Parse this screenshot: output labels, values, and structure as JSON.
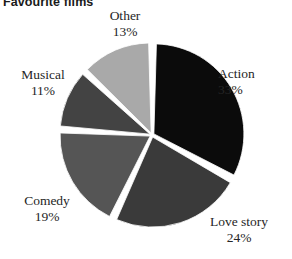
{
  "chart_data": {
    "type": "pie",
    "title": "Favourite films",
    "xlabel": "",
    "ylabel": "",
    "legend_position": "none",
    "grid": false,
    "start_angle_deg": 0,
    "direction": "clockwise",
    "categories": [
      "Action",
      "Love story",
      "Comedy",
      "Musical",
      "Other"
    ],
    "values": [
      33,
      24,
      19,
      11,
      13
    ],
    "value_unit": "%",
    "slices": [
      {
        "label": "Action",
        "value": 33,
        "value_text": "33%",
        "color": "#0b0b0b",
        "start_deg": 0,
        "end_deg": 118.8
      },
      {
        "label": "Love story",
        "value": 24,
        "value_text": "24%",
        "color": "#3a3a3a",
        "start_deg": 118.8,
        "end_deg": 205.2
      },
      {
        "label": "Comedy",
        "value": 19,
        "value_text": "19%",
        "color": "#555555",
        "start_deg": 205.2,
        "end_deg": 273.6
      },
      {
        "label": "Musical",
        "value": 11,
        "value_text": "11%",
        "color": "#434343",
        "start_deg": 273.6,
        "end_deg": 313.2
      },
      {
        "label": "Other",
        "value": 13,
        "value_text": "13%",
        "color": "#a9a9a9",
        "start_deg": 313.2,
        "end_deg": 360
      }
    ],
    "background_color": "#ffffff",
    "separator_color": "#ffffff"
  },
  "labels": {
    "action": {
      "name": "Action",
      "pct": "33%"
    },
    "love": {
      "name": "Love story",
      "pct": "24%"
    },
    "comedy": {
      "name": "Comedy",
      "pct": "19%"
    },
    "musical": {
      "name": "Musical",
      "pct": "11%"
    },
    "other": {
      "name": "Other",
      "pct": "13%"
    }
  }
}
